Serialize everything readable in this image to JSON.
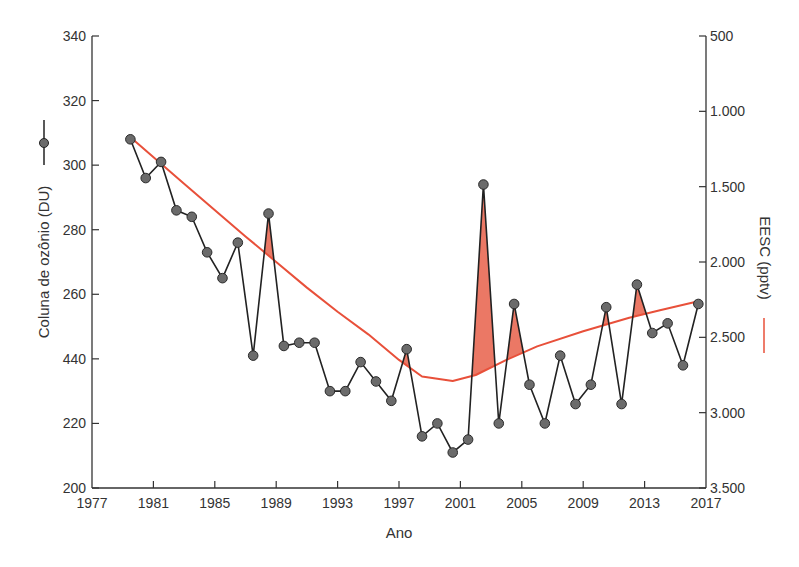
{
  "chart_data": {
    "type": "line",
    "title": "",
    "xlabel": "Ano",
    "ylabel_left": "Coluna de ozônio (DU)",
    "ylabel_right": "EESC (pptv)",
    "x_ticks": [
      "1977",
      "1981",
      "1985",
      "1989",
      "1993",
      "1997",
      "2001",
      "2005",
      "2009",
      "2013",
      "2017"
    ],
    "x_range": [
      1977,
      2017
    ],
    "y_left_ticks": [
      "340",
      "320",
      "300",
      "280",
      "260",
      "440",
      "220",
      "200"
    ],
    "y_left_tick_values": [
      340,
      320,
      300,
      280,
      260,
      240,
      220,
      200
    ],
    "y_left_range": [
      200,
      340
    ],
    "y_right_ticks": [
      "500",
      "1.000",
      "1.500",
      "2.000",
      "2.500",
      "3.000",
      "3.500"
    ],
    "y_right_tick_values": [
      500,
      1000,
      1500,
      2000,
      2500,
      3000,
      3500
    ],
    "y_right_range": [
      3500,
      500
    ],
    "y_right_inverted": true,
    "grid": false,
    "legend": [
      {
        "label": "Coluna de ozônio (DU)",
        "style": "black line with gray circle markers",
        "position": "left axis title"
      },
      {
        "label": "EESC (pptv)",
        "style": "red line",
        "position": "right axis title"
      }
    ],
    "annotations": "Red shaded areas where ozone column exceeds the EESC curve",
    "series": [
      {
        "name": "Coluna de ozônio (DU)",
        "axis": "left",
        "color": "#222222",
        "marker_color": "#6b6b6b",
        "x": [
          1979.5,
          1980.5,
          1981.5,
          1982.5,
          1983.5,
          1984.5,
          1985.5,
          1986.5,
          1987.5,
          1988.5,
          1989.5,
          1990.5,
          1991.5,
          1992.5,
          1993.5,
          1994.5,
          1995.5,
          1996.5,
          1997.5,
          1998.5,
          1999.5,
          2000.5,
          2001.5,
          2002.5,
          2003.5,
          2004.5,
          2005.5,
          2006.5,
          2007.5,
          2008.5,
          2009.5,
          2010.5,
          2011.5,
          2012.5,
          2013.5,
          2014.5,
          2015.5,
          2016.5
        ],
        "values": [
          308,
          296,
          301,
          286,
          284,
          273,
          265,
          276,
          241,
          285,
          244,
          245,
          245,
          230,
          230,
          239,
          233,
          227,
          243,
          216,
          220,
          211,
          215,
          294,
          220,
          257,
          232,
          220,
          241,
          226,
          232,
          256,
          226,
          263,
          248,
          251,
          238,
          257
        ]
      },
      {
        "name": "EESC (pptv)",
        "axis": "right",
        "color": "#e8503a",
        "x": [
          1979.6,
          1983,
          1987,
          1989,
          1991,
          1993,
          1995,
          1997,
          1998.5,
          2000.5,
          2002,
          2004,
          2006,
          2009,
          2012,
          2014,
          2016.5
        ],
        "values": [
          1180,
          1480,
          1830,
          2000,
          2170,
          2330,
          2480,
          2650,
          2760,
          2790,
          2750,
          2650,
          2560,
          2460,
          2370,
          2320,
          2260
        ]
      }
    ]
  }
}
